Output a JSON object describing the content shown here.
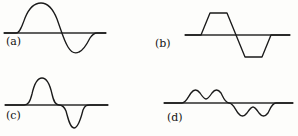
{
  "figure": {
    "background_color": "#fdfdfb",
    "stroke_color": "#1a1a1a",
    "axis_color": "#2b2b2b"
  },
  "panels": [
    {
      "id": "a",
      "label": "(a)",
      "description": "smooth sine-like doublet: large rounded positive lobe followed by smaller rounded negative lobe",
      "axis": {
        "x1": 4,
        "y": 33,
        "x2": 106
      },
      "curve": "M 4 33 L 16 33 C 20 33 22 26 25 18 C 29 8 34 3 41 3 C 48 3 53 9 57 19 C 61 30 64 41 68 47 C 71 52 75 54 79 52 C 84 50 87 44 90 38 C 92 35 94 33 97 33 L 106 33"
    },
    {
      "id": "b",
      "label": "(b)",
      "description": "trapezoidal doublet: positive trapezoid pulse followed by negative trapezoid pulse",
      "axis": {
        "x1": 36,
        "y": 35,
        "x2": 141
      },
      "curve": "M 36 35 L 52 35 L 61 13 L 78 13 L 87 35 L 87 35 L 96 57 L 113 57 L 122 35 L 141 35"
    },
    {
      "id": "c",
      "label": "(c)",
      "description": "narrow sharp doublet: tall narrow positive pulse followed by deep narrow negative pulse",
      "axis": {
        "x1": 5,
        "y": 37,
        "x2": 108
      },
      "curve": "M 5 37 L 24 37 C 28 37 30 34 32 26 C 34 17 37 10 42 10 C 47 10 50 17 52 26 C 54 35 56 37 59 37 C 62 37 64 38 66 43 C 68 50 70 60 74 60 C 78 60 81 50 83 42 C 85 37 87 37 90 37 L 108 37"
    },
    {
      "id": "d",
      "label": "(d)",
      "description": "double-humped doublet: two-peaked positive lobe followed by mirrored two-troughed negative lobe",
      "axis": {
        "x1": 15,
        "y": 35,
        "x2": 144
      },
      "curve": "M 15 35 L 33 35 C 37 35 39 29 42 25 C 45 21 48 21 51 25 C 53 28 55 31 57 31 C 59 31 61 28 63 25 C 66 21 69 21 72 25 C 74 29 76 35 80 35 L 80 35 C 84 35 86 41 89 45 C 92 49 95 49 98 45 C 100 42 102 39 104 39 C 106 39 108 42 110 45 C 113 49 116 49 119 45 C 121 41 123 35 127 35 L 144 35"
    }
  ]
}
